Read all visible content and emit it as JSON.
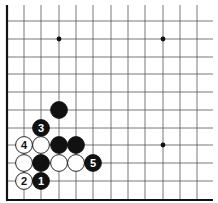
{
  "diagram": {
    "type": "go-board-fragment",
    "corner": "bottom-left",
    "grid": {
      "columns_x": [
        7,
        24,
        41,
        59,
        76,
        93,
        111,
        128,
        145,
        163,
        180,
        197
      ],
      "rows_y": [
        200,
        181,
        163,
        145,
        128,
        110,
        92,
        74,
        57,
        39,
        21
      ],
      "right_extent": 213,
      "top_extent": 5,
      "line_color": "#555555",
      "edge_color": "#111111"
    },
    "star_points": [
      {
        "col": 3,
        "row": 9
      },
      {
        "col": 9,
        "row": 9
      },
      {
        "col": 9,
        "row": 3
      }
    ],
    "stones": [
      {
        "color": "black",
        "col": 3,
        "row": 5,
        "label": ""
      },
      {
        "color": "black",
        "col": 2,
        "row": 4,
        "label": "3"
      },
      {
        "color": "white",
        "col": 1,
        "row": 3,
        "label": "4"
      },
      {
        "color": "white",
        "col": 2,
        "row": 3,
        "label": ""
      },
      {
        "color": "black",
        "col": 3,
        "row": 3,
        "label": ""
      },
      {
        "color": "black",
        "col": 4,
        "row": 3,
        "label": ""
      },
      {
        "color": "white",
        "col": 1,
        "row": 2,
        "label": ""
      },
      {
        "color": "black",
        "col": 2,
        "row": 2,
        "label": ""
      },
      {
        "color": "white",
        "col": 3,
        "row": 2,
        "label": ""
      },
      {
        "color": "white",
        "col": 4,
        "row": 2,
        "label": ""
      },
      {
        "color": "black",
        "col": 5,
        "row": 2,
        "label": "5"
      },
      {
        "color": "white",
        "col": 1,
        "row": 1,
        "label": "2"
      },
      {
        "color": "black",
        "col": 2,
        "row": 1,
        "label": "1"
      }
    ],
    "colors": {
      "black_stone": "#111111",
      "white_stone": "#ffffff",
      "stone_outline": "#111111",
      "black_label": "#ffffff",
      "white_label": "#111111"
    }
  }
}
